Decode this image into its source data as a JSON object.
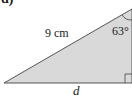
{
  "part_label": "d)",
  "triangle": {
    "fill_color": "#d9d9d9",
    "stroke_color": "#555555",
    "hypotenuse_label": "9 cm",
    "angle_label": "63°",
    "base_label": "d",
    "right_angle_marker": true
  }
}
